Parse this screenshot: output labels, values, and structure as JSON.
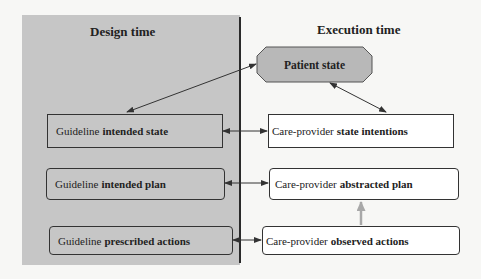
{
  "headings": {
    "design_time": "Design time",
    "execution_time": "Execution time"
  },
  "patient_state": {
    "label": "Patient state",
    "fill": "#b8b8b8"
  },
  "design_boxes": [
    {
      "prefix": "Guideline",
      "emphasis": "intended state"
    },
    {
      "prefix": "Guideline",
      "emphasis": "intended plan"
    },
    {
      "prefix": "Guideline",
      "emphasis": "prescribed actions"
    }
  ],
  "execution_boxes": [
    {
      "prefix": "Care-provider",
      "emphasis": "state intentions"
    },
    {
      "prefix": "Care-provider",
      "emphasis": "abstracted plan"
    },
    {
      "prefix": "Care-provider",
      "emphasis": "observed actions"
    }
  ],
  "colors": {
    "design_panel": "#c6c6c6",
    "execution_bg": "#f7f7f5",
    "line": "#333333",
    "abstraction_arrow": "#a8a8a8"
  }
}
